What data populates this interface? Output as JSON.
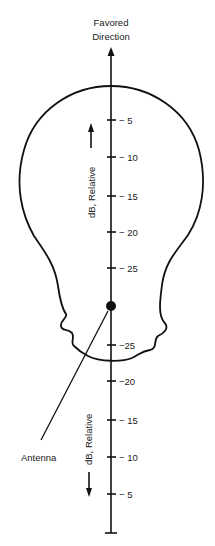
{
  "title": {
    "line1": "Favored",
    "line2": "Direction"
  },
  "axis": {
    "label_upper": "dB, Relative",
    "label_lower": "dB, Relative",
    "upper_ticks": [
      "− 5",
      "− 10",
      "− 15",
      "− 20",
      "− 25"
    ],
    "lower_ticks": [
      "−25",
      "−20",
      "− 15",
      "− 10",
      "− 5"
    ]
  },
  "antenna": {
    "label": "Antenna"
  },
  "icons": {
    "upper_arrow": "arrow-up-icon",
    "lower_arrow": "arrow-down-icon",
    "axis_arrow": "arrow-up-icon"
  },
  "colors": {
    "line": "#111111",
    "background": "#ffffff"
  }
}
